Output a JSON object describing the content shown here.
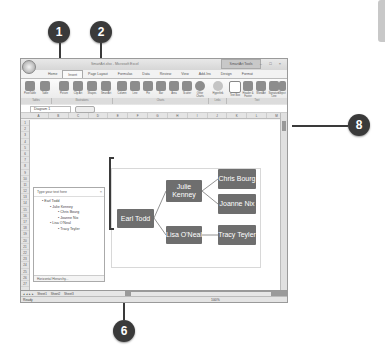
{
  "callouts": [
    {
      "id": "1",
      "label": "1"
    },
    {
      "id": "2",
      "label": "2"
    },
    {
      "id": "6",
      "label": "6"
    },
    {
      "id": "8",
      "label": "8"
    }
  ],
  "window": {
    "title": "SmartArt.xlsx - Microsoft Excel",
    "context_tab_group": "SmartArt Tools",
    "controls": "– □ ×"
  },
  "tabs": [
    "Home",
    "Insert",
    "Page Layout",
    "Formulas",
    "Data",
    "Review",
    "View",
    "Add-Ins",
    "Design",
    "Format"
  ],
  "active_tab": "Insert",
  "ribbon": {
    "buttons": [
      {
        "label": "PivotTable",
        "x": 2
      },
      {
        "label": "Table",
        "x": 17
      },
      {
        "label": "Picture",
        "x": 36
      },
      {
        "label": "Clip Art",
        "x": 50
      },
      {
        "label": "Shapes",
        "x": 64
      },
      {
        "label": "SmartArt",
        "x": 78
      },
      {
        "label": "Column",
        "x": 94
      },
      {
        "label": "Line",
        "x": 107
      },
      {
        "label": "Pie",
        "x": 120
      },
      {
        "label": "Bar",
        "x": 133
      },
      {
        "label": "Area",
        "x": 146
      },
      {
        "label": "Scatter",
        "x": 159
      },
      {
        "label": "Other Charts",
        "x": 172
      },
      {
        "label": "Hyperlink",
        "x": 190
      },
      {
        "label": "Text Box",
        "x": 207
      },
      {
        "label": "Header & Footer",
        "x": 220
      },
      {
        "label": "WordArt",
        "x": 233
      },
      {
        "label": "Signature Line",
        "x": 246
      },
      {
        "label": "Object",
        "x": 256
      },
      {
        "label": "Symbol",
        "x": 266
      }
    ],
    "groups": [
      {
        "label": "Tables",
        "x": 0,
        "w": 30
      },
      {
        "label": "Illustrations",
        "x": 31,
        "w": 60
      },
      {
        "label": "Charts",
        "x": 92,
        "w": 95
      },
      {
        "label": "Links",
        "x": 188,
        "w": 17
      },
      {
        "label": "Text",
        "x": 206,
        "w": 60
      }
    ]
  },
  "formula_bar": {
    "name_box": "Diagram 1",
    "fx": "fx"
  },
  "columns": [
    "A",
    "B",
    "C",
    "D",
    "E",
    "F",
    "G",
    "H",
    "I",
    "J",
    "K",
    "L",
    "M",
    "N",
    "O"
  ],
  "rows": [
    "1",
    "2",
    "3",
    "4",
    "5",
    "6",
    "7",
    "8",
    "9",
    "10",
    "11",
    "12",
    "13",
    "14",
    "15",
    "16",
    "17",
    "18",
    "19",
    "20",
    "21",
    "22",
    "23",
    "24",
    "25",
    "26",
    "27"
  ],
  "text_pane": {
    "header": "Type your text here",
    "close": "×",
    "items": [
      {
        "text": "Earl Todd",
        "level": 1
      },
      {
        "text": "Julie Kenney",
        "level": 2
      },
      {
        "text": "Chris Bourg",
        "level": 3
      },
      {
        "text": "Joanne Nix",
        "level": 3
      },
      {
        "text": "Lisa O'Neal",
        "level": 2
      },
      {
        "text": "Tracy Teyler",
        "level": 3
      }
    ],
    "footer": "Horizontal Hierarchy..."
  },
  "diagram": {
    "type": "Horizontal Hierarchy",
    "node_color": "#6e6e6e",
    "nodes": [
      {
        "id": "earl",
        "text": "Earl Todd"
      },
      {
        "id": "julie",
        "text": "Julie Kenney"
      },
      {
        "id": "lisa",
        "text": "Lisa O'Neal"
      },
      {
        "id": "chris",
        "text": "Chris Bourg"
      },
      {
        "id": "joanne",
        "text": "Joanne Nix"
      },
      {
        "id": "tracy",
        "text": "Tracy Teyler"
      }
    ]
  },
  "sheet_tabs": [
    "Sheet1",
    "Sheet2",
    "Sheet3"
  ],
  "active_sheet": "Sheet1",
  "status": {
    "ready": "Ready",
    "zoom": "100%"
  }
}
